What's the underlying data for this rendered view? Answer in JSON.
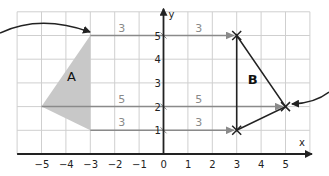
{
  "diagram": {
    "axes": {
      "x_label": "x",
      "y_label": "y",
      "x_ticks": [
        "−5",
        "−4",
        "−3",
        "−2",
        "−1",
        "0",
        "1",
        "2",
        "3",
        "4",
        "5"
      ],
      "x_tick_values": [
        -5,
        -4,
        -3,
        -2,
        -1,
        0,
        1,
        2,
        3,
        4,
        5
      ],
      "y_ticks": [
        "1",
        "2",
        "3",
        "4",
        "5"
      ],
      "y_tick_values": [
        1,
        2,
        3,
        4,
        5
      ],
      "x_range": [
        -6,
        6
      ],
      "y_range": [
        0,
        6
      ]
    },
    "shape_a": {
      "label": "A",
      "vertices": [
        [
          -3,
          5
        ],
        [
          -3,
          1
        ],
        [
          -5,
          2
        ]
      ],
      "fill": "#c8c8c8"
    },
    "shape_b": {
      "label": "B",
      "vertices": [
        [
          3,
          5
        ],
        [
          3,
          1
        ],
        [
          5,
          2
        ]
      ],
      "fill": "none"
    },
    "translation_arrows": [
      {
        "from": [
          -3,
          5
        ],
        "to": [
          3,
          5
        ],
        "segments": [
          {
            "label": "3"
          },
          {
            "label": "3"
          }
        ]
      },
      {
        "from": [
          -5,
          2
        ],
        "to": [
          5,
          2
        ],
        "segments": [
          {
            "label": "5"
          },
          {
            "label": "5"
          }
        ]
      },
      {
        "from": [
          -3,
          1
        ],
        "to": [
          3,
          1
        ],
        "segments": [
          {
            "label": "3"
          },
          {
            "label": "3"
          }
        ]
      }
    ],
    "labels": {
      "a": "A",
      "b": "B",
      "top_3_left": "3",
      "top_3_right": "3",
      "mid_5_left": "5",
      "mid_5_right": "5",
      "bot_3_left": "3",
      "bot_3_right": "3"
    },
    "colors": {
      "grid": "#cfcfcf",
      "axis": "#222222",
      "translation_line": "#8a8a8a",
      "shape_a_fill": "#c8c8c8",
      "shape_b_stroke": "#222222"
    }
  }
}
